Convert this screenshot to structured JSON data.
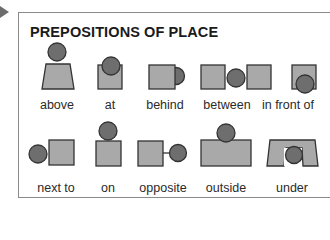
{
  "title": "PREPOSITIONS OF PLACE",
  "colors": {
    "box_fill": "#a9a9a9",
    "circle_fill": "#6e6e6e",
    "stroke": "#333333",
    "border": "#8a8a8a",
    "arrow": "#6c6c6c"
  },
  "rows": [
    {
      "items": [
        {
          "label": "above",
          "icon": "ball-above-box-icon"
        },
        {
          "label": "at",
          "icon": "ball-at-box-icon"
        },
        {
          "label": "behind",
          "icon": "ball-behind-box-icon"
        },
        {
          "label": "between",
          "icon": "ball-between-boxes-icon"
        },
        {
          "label": "in front of",
          "icon": "ball-in-front-of-box-icon"
        }
      ]
    },
    {
      "items": [
        {
          "label": "next to",
          "icon": "ball-next-to-box-icon"
        },
        {
          "label": "on",
          "icon": "ball-on-box-icon"
        },
        {
          "label": "opposite",
          "icon": "ball-opposite-box-icon"
        },
        {
          "label": "outside",
          "icon": "ball-outside-box-icon"
        },
        {
          "label": "under",
          "icon": "ball-under-box-icon"
        }
      ]
    }
  ]
}
